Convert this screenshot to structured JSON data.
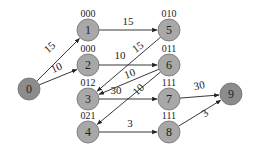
{
  "diagram": {
    "type": "directed-graph",
    "colors": {
      "node_fill": "#a8a8a8",
      "node_fill_dark": "#8c8c8c",
      "node_stroke": "#6e6e6e",
      "edge": "#222222",
      "text": "#222222"
    },
    "nodes": [
      {
        "id": "0",
        "label": "0",
        "code": "",
        "x": 29,
        "y": 89,
        "dark": true
      },
      {
        "id": "1",
        "label": "1",
        "code": "000",
        "x": 88,
        "y": 30,
        "dark": false
      },
      {
        "id": "2",
        "label": "2",
        "code": "000",
        "x": 88,
        "y": 65,
        "dark": false
      },
      {
        "id": "3",
        "label": "3",
        "code": "012",
        "x": 88,
        "y": 99,
        "dark": false
      },
      {
        "id": "4",
        "label": "4",
        "code": "021",
        "x": 88,
        "y": 132,
        "dark": false
      },
      {
        "id": "5",
        "label": "5",
        "code": "010",
        "x": 169,
        "y": 30,
        "dark": false
      },
      {
        "id": "6",
        "label": "6",
        "code": "011",
        "x": 169,
        "y": 65,
        "dark": false
      },
      {
        "id": "7",
        "label": "7",
        "code": "111",
        "x": 169,
        "y": 99,
        "dark": false
      },
      {
        "id": "8",
        "label": "8",
        "code": "111",
        "x": 169,
        "y": 132,
        "dark": false
      },
      {
        "id": "9",
        "label": "9",
        "code": "",
        "x": 231,
        "y": 94,
        "dark": true
      }
    ],
    "edges": [
      {
        "from": "0",
        "to": "1",
        "weight": "15",
        "lx": 52,
        "ly": 50,
        "rot": -42
      },
      {
        "from": "0",
        "to": "2",
        "weight": "10",
        "lx": 58,
        "ly": 71,
        "rot": -25
      },
      {
        "from": "1",
        "to": "5",
        "weight": "15",
        "lx": 128,
        "ly": 25,
        "rot": 0
      },
      {
        "from": "2",
        "to": "6",
        "weight": "10",
        "lx": 120,
        "ly": 59,
        "rot": 0
      },
      {
        "from": "5",
        "to": "3",
        "weight": "15",
        "lx": 140,
        "ly": 50,
        "rot": -36
      },
      {
        "from": "6",
        "to": "3",
        "weight": "10",
        "lx": 131,
        "ly": 77,
        "rot": -20
      },
      {
        "from": "6",
        "to": "4",
        "weight": "10",
        "lx": 141,
        "ly": 92,
        "rot": -45
      },
      {
        "from": "3",
        "to": "7",
        "weight": "30",
        "lx": 116,
        "ly": 94,
        "rot": 0
      },
      {
        "from": "4",
        "to": "8",
        "weight": "3",
        "lx": 130,
        "ly": 127,
        "rot": 0
      },
      {
        "from": "7",
        "to": "9",
        "weight": "30",
        "lx": 200,
        "ly": 89,
        "rot": -12
      },
      {
        "from": "8",
        "to": "9",
        "weight": "3",
        "lx": 207,
        "ly": 116,
        "rot": -40
      }
    ]
  }
}
